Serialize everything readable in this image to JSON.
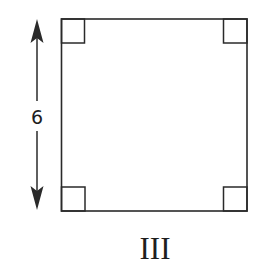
{
  "figure": {
    "shape": "square",
    "label": "III",
    "side_dimension": {
      "value": "6",
      "orientation": "vertical",
      "position": "left"
    },
    "right_angle_markers": [
      "top-left",
      "top-right",
      "bottom-left",
      "bottom-right"
    ],
    "colors": {
      "stroke": "#2a2a2a",
      "background": "#ffffff"
    }
  }
}
